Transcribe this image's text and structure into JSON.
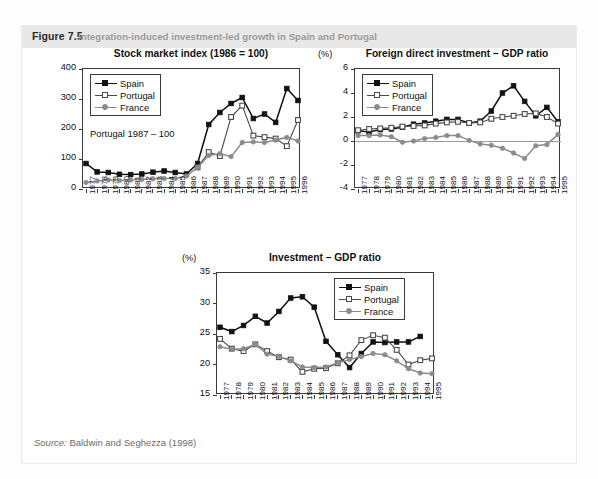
{
  "figure": {
    "number": "Figure 7.5",
    "caption": "Integration-induced investment-led growth in Spain and Portugal",
    "source_prefix": "Source:",
    "source_text": "Baldwin and Seghezza (1998)"
  },
  "colors": {
    "spain": "#111111",
    "portugal": "#111111",
    "portugal_fill": "#ffffff",
    "france": "#8c8c8c",
    "axis": "#3a3a3a",
    "header_bg": "#e9e8e8",
    "caption_text": "#9b9a9a"
  },
  "legend_labels": {
    "spain": "Spain",
    "portugal": "Portugal",
    "france": "France"
  },
  "chart_data": [
    {
      "id": "stock-market-index",
      "type": "line",
      "title": "Stock market index (1986 = 100)",
      "unit_label": "",
      "annotation": "Portugal 1987 – 100",
      "xlabel": "",
      "ylabel": "",
      "ylim": [
        0,
        400
      ],
      "yticks": [
        0,
        100,
        200,
        300,
        400
      ],
      "grid": false,
      "legend_position": "top-left",
      "categories": [
        "1977",
        "1978",
        "1979",
        "1980",
        "1981",
        "1982",
        "1983",
        "1984",
        "1985",
        "1986",
        "1987",
        "1988",
        "1989",
        "1990",
        "1991",
        "1992",
        "1993",
        "1994",
        "1995",
        "1996"
      ],
      "series": [
        {
          "name": "Spain",
          "values": [
            85,
            57,
            55,
            49,
            48,
            50,
            56,
            60,
            55,
            50,
            85,
            215,
            255,
            285,
            305,
            235,
            250,
            222,
            335,
            295,
            325
          ]
        },
        {
          "name": "Portugal",
          "values": [
            null,
            null,
            null,
            null,
            null,
            null,
            null,
            null,
            null,
            null,
            72,
            123,
            110,
            240,
            278,
            178,
            173,
            168,
            143,
            230,
            240,
            218
          ]
        },
        {
          "name": "France",
          "values": [
            22,
            27,
            30,
            28,
            30,
            32,
            34,
            35,
            35,
            43,
            72,
            112,
            118,
            108,
            155,
            157,
            155,
            163,
            172,
            160,
            180,
            163,
            185
          ]
        }
      ]
    },
    {
      "id": "fdi-gdp-ratio",
      "type": "line",
      "title": "Foreign direct investment – GDP ratio",
      "unit_label": "(%)",
      "annotation": "",
      "xlabel": "",
      "ylabel": "",
      "ylim": [
        -4,
        6
      ],
      "yticks": [
        -4,
        -2,
        0,
        2,
        4,
        6
      ],
      "grid": false,
      "legend_position": "top-left",
      "categories": [
        "1977",
        "1978",
        "1979",
        "1980",
        "1981",
        "1982",
        "1983",
        "1984",
        "1985",
        "1986",
        "1987",
        "1988",
        "1989",
        "1990",
        "1991",
        "1992",
        "1993",
        "1994",
        "1995"
      ],
      "series": [
        {
          "name": "Spain",
          "values": [
            0.85,
            0.75,
            0.95,
            1.0,
            1.15,
            1.4,
            1.5,
            1.65,
            1.8,
            1.8,
            1.5,
            1.65,
            2.5,
            4.0,
            4.6,
            3.3,
            2.1,
            2.8,
            1.6,
            1.75
          ]
        },
        {
          "name": "Portugal",
          "values": [
            0.9,
            1.0,
            1.05,
            1.1,
            1.2,
            1.25,
            1.3,
            1.45,
            1.55,
            1.6,
            1.5,
            1.55,
            1.85,
            2.0,
            2.1,
            2.25,
            2.3,
            2.0,
            1.45,
            1.55
          ]
        },
        {
          "name": "France",
          "values": [
            0.45,
            0.45,
            0.5,
            0.35,
            -0.1,
            0.0,
            0.2,
            0.3,
            0.45,
            0.45,
            0.05,
            -0.25,
            -0.35,
            -0.6,
            -1.0,
            -1.45,
            -0.4,
            -0.3,
            0.55,
            -0.05,
            0.8
          ]
        }
      ]
    },
    {
      "id": "investment-gdp-ratio",
      "type": "line",
      "title": "Investment – GDP ratio",
      "unit_label": "(%)",
      "annotation": "",
      "xlabel": "",
      "ylabel": "",
      "ylim": [
        15,
        35
      ],
      "yticks": [
        15,
        20,
        25,
        30,
        35
      ],
      "grid": false,
      "legend_position": "top-right",
      "categories": [
        "1977",
        "1978",
        "1979",
        "1980",
        "1981",
        "1982",
        "1983",
        "1984",
        "1985",
        "1986",
        "1987",
        "1988",
        "1989",
        "1990",
        "1991",
        "1992",
        "1993",
        "1994",
        "1995"
      ],
      "series": [
        {
          "name": "Spain",
          "values": [
            26.1,
            25.4,
            26.4,
            27.9,
            26.8,
            28.7,
            30.9,
            31.1,
            29.4,
            23.8,
            21.6,
            19.5,
            21.8,
            23.7,
            23.6,
            23.7,
            23.7,
            24.6
          ]
        },
        {
          "name": "Portugal",
          "values": [
            24.2,
            22.6,
            22.2,
            23.3,
            22.2,
            21.2,
            20.8,
            18.8,
            19.3,
            19.4,
            20.2,
            21.5,
            24.0,
            24.8,
            24.4,
            22.4,
            20.0,
            20.7,
            21.0
          ]
        },
        {
          "name": "France",
          "values": [
            22.9,
            22.5,
            22.6,
            23.3,
            21.7,
            21.3,
            20.6,
            19.6,
            19.5,
            19.6,
            20.3,
            20.8,
            21.3,
            21.8,
            21.6,
            20.6,
            19.3,
            18.6,
            18.5
          ]
        }
      ]
    }
  ]
}
